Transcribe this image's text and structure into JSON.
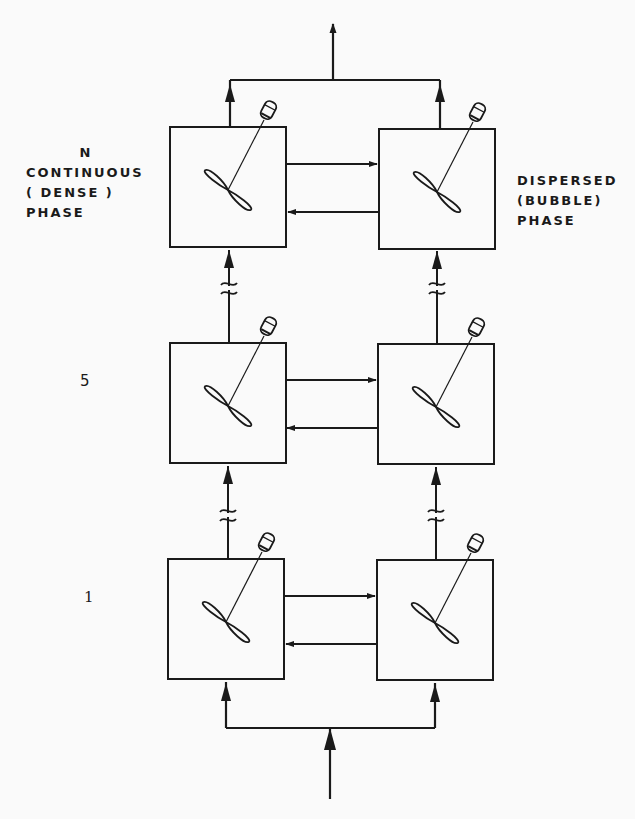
{
  "labels": {
    "continuous_phase": {
      "line1": "N",
      "line2": "CONTINUOUS",
      "line3": "( DENSE )",
      "line4": "PHASE"
    },
    "dispersed_phase": {
      "line1": "DISPERSED",
      "line2": "(BUBBLE)",
      "line3": "PHASE"
    }
  },
  "stages": [
    {
      "label": "N",
      "position": "top"
    },
    {
      "label": "5",
      "position": "middle"
    },
    {
      "label": "1",
      "position": "bottom"
    }
  ],
  "stage_numbers": {
    "middle": "5",
    "bottom": "1"
  },
  "components": {
    "vessel": "stirred-tank-icon",
    "impeller": "propeller-icon",
    "motor": "motor-icon",
    "break": "line-break-icon"
  },
  "colors": {
    "line": "#1a1a1a",
    "background": "#fafafa"
  }
}
